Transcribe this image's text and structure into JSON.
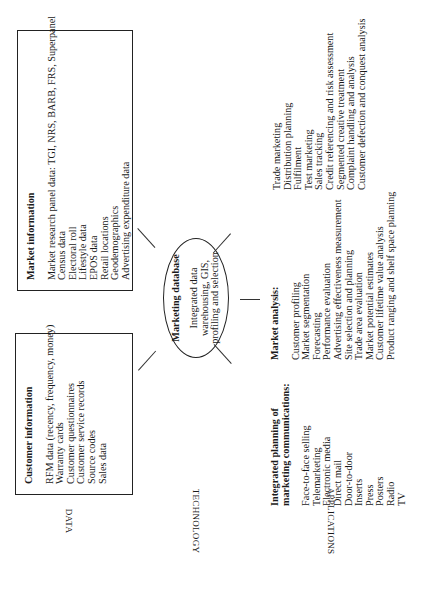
{
  "row_labels": {
    "data": "DATA",
    "technology": "TECHNOLOGY",
    "applications": "APPLICATIONS"
  },
  "customer_information": {
    "title": "Customer information",
    "items": [
      "RFM data (recency, frequency, money)",
      "Warranty cards",
      "Customer questionnaires",
      "Customer service records",
      "Source codes",
      "Sales data"
    ]
  },
  "market_information": {
    "title": "Market information",
    "items": [
      "Market research panel data: TGI, NRS, BARB, FRS, Superpanel",
      "Census data",
      "Electoral roll",
      "Lifestyle data",
      "EPOS data",
      "Retail locations",
      "Geodemographics",
      "Advertising expenditure data"
    ]
  },
  "marketing_database": {
    "title": "Marketing database",
    "lines": [
      "Integrated data",
      "warehousing, GIS,",
      "profiling and selection"
    ]
  },
  "integrated_planning": {
    "title_lines": [
      "Integrated planning of",
      "marketing communications:"
    ],
    "items": [
      "Face-to-face selling",
      "Telemarketing",
      "Electronic media",
      "Direct mail",
      "Door-to-door",
      "Inserts",
      "Press",
      "Posters",
      "Radio",
      "TV"
    ]
  },
  "market_analysis": {
    "title": "Market analysis:",
    "items": [
      "Customer profiling",
      "Market segmentation",
      "Forecasting",
      "Performance evaluation",
      "Advertising effectiveness measurement",
      "Site selection and planning",
      "Trade area evaluation",
      "Market potential estimates",
      "Customer lifetime value analysis",
      "Product ranging and shelf space planning"
    ]
  },
  "other_applications": {
    "items": [
      "Trade marketing",
      "Distribution planning",
      "Fulfilment",
      "Test marketing",
      "Sales tracking",
      "Credit referencing and risk assessment",
      "Segmented creative treatment",
      "Complaint handling and analysis",
      "Customer defection and conquest analysis"
    ]
  }
}
